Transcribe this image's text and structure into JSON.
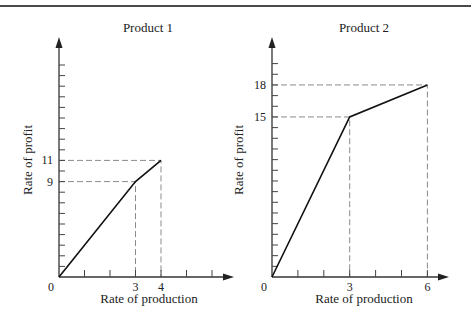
{
  "chart_data": [
    {
      "type": "line",
      "title": "Product 1",
      "xlabel": "Rate of production",
      "ylabel": "Rate of profit",
      "x": [
        0,
        3,
        4
      ],
      "y": [
        0,
        9,
        11
      ],
      "series": [
        {
          "name": "Product 1 profit",
          "x": [
            0,
            3,
            4
          ],
          "values": [
            0,
            9,
            11
          ]
        }
      ],
      "x_tick_count": 6,
      "y_tick_count": 20,
      "x_tick_labels": [
        {
          "value": 0,
          "label": "0"
        },
        {
          "value": 3,
          "label": "3"
        },
        {
          "value": 4,
          "label": "4"
        }
      ],
      "y_tick_labels": [
        {
          "value": 9,
          "label": "9"
        },
        {
          "value": 11,
          "label": "11"
        }
      ],
      "guide_lines": [
        {
          "x": 3,
          "y": 9
        },
        {
          "x": 4,
          "y": 11
        }
      ],
      "xlim": [
        0,
        6.8
      ],
      "ylim": [
        0,
        22
      ],
      "grid": false,
      "legend": "none"
    },
    {
      "type": "line",
      "title": "Product 2",
      "xlabel": "Rate of production",
      "ylabel": "Rate of profit",
      "x": [
        0,
        3,
        6
      ],
      "y": [
        0,
        15,
        18
      ],
      "series": [
        {
          "name": "Product 2 profit",
          "x": [
            0,
            3,
            6
          ],
          "values": [
            0,
            15,
            18
          ]
        }
      ],
      "x_tick_count": 6,
      "y_tick_count": 20,
      "x_tick_labels": [
        {
          "value": 0,
          "label": "0"
        },
        {
          "value": 3,
          "label": "3"
        },
        {
          "value": 6,
          "label": "6"
        }
      ],
      "y_tick_labels": [
        {
          "value": 15,
          "label": "15"
        },
        {
          "value": 18,
          "label": "18"
        }
      ],
      "guide_lines": [
        {
          "x": 3,
          "y": 15
        },
        {
          "x": 6,
          "y": 18
        }
      ],
      "xlim": [
        0,
        6.8
      ],
      "ylim": [
        0,
        22
      ],
      "grid": false,
      "legend": "none"
    }
  ]
}
